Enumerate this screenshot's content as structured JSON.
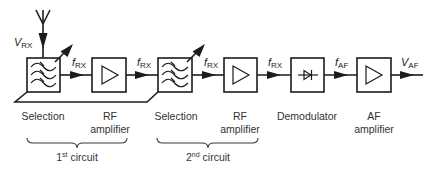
{
  "diagram": {
    "type": "superheterodyne-free TRF receiver block diagram",
    "colors": {
      "line": "#1c1c1c",
      "text": "#333333",
      "background": "#ffffff"
    },
    "input": {
      "symbol": "antenna-icon",
      "label_main": "V",
      "label_sub": "RX"
    },
    "signals": [
      {
        "main": "f",
        "sub": "RX"
      },
      {
        "main": "f",
        "sub": "RX"
      },
      {
        "main": "f",
        "sub": "RX"
      },
      {
        "main": "f",
        "sub": "RX"
      },
      {
        "main": "f",
        "sub": "AF"
      }
    ],
    "output": {
      "main": "V",
      "sub": "AF"
    },
    "blocks": [
      {
        "id": "selection-1",
        "symbol": "bandpass-filter-icon",
        "line1": "Selection",
        "line2": ""
      },
      {
        "id": "rf-amplifier-1",
        "symbol": "amplifier-icon",
        "line1": "RF",
        "line2": "amplifier"
      },
      {
        "id": "selection-2",
        "symbol": "bandpass-filter-icon",
        "line1": "Selection",
        "line2": ""
      },
      {
        "id": "rf-amplifier-2",
        "symbol": "amplifier-icon",
        "line1": "RF",
        "line2": "amplifier"
      },
      {
        "id": "demodulator",
        "symbol": "diode-icon",
        "line1": "Demodulator",
        "line2": ""
      },
      {
        "id": "af-amplifier",
        "symbol": "amplifier-icon",
        "line1": "AF",
        "line2": "amplifier"
      }
    ],
    "groups": [
      {
        "num": "1",
        "sup": "st",
        "text": " circuit"
      },
      {
        "num": "2",
        "sup": "nd",
        "text": " circuit"
      }
    ]
  }
}
